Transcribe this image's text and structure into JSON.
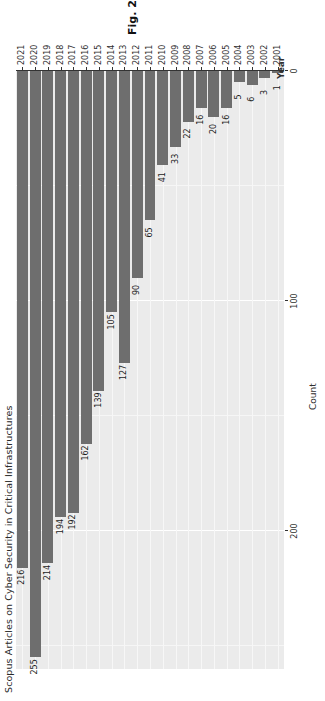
{
  "figure": {
    "caption_label": "Fig. 2",
    "caption_text": "Research trends 2001–21."
  },
  "chart_data": {
    "type": "bar",
    "orientation": "vertical",
    "title": "Scopus Articles on Cyber Security in Critical Infrastructures",
    "xlabel": "Year",
    "ylabel": "Count",
    "ylim": [
      0,
      260
    ],
    "yticks": [
      0,
      100,
      200
    ],
    "ytick_labels": [
      "0",
      "100",
      "200"
    ],
    "grid": true,
    "legend": "none",
    "bar_color": "#6e6e6e",
    "panel_color": "#ebebeb",
    "gridline_color": "#ffffff",
    "categories": [
      "2001",
      "2002",
      "2003",
      "2004",
      "2005",
      "2006",
      "2007",
      "2008",
      "2009",
      "2010",
      "2011",
      "2012",
      "2013",
      "2014",
      "2015",
      "2016",
      "2017",
      "2018",
      "2019",
      "2020",
      "2021"
    ],
    "values": [
      1,
      3,
      6,
      5,
      16,
      20,
      16,
      22,
      33,
      41,
      65,
      90,
      127,
      105,
      139,
      162,
      192,
      194,
      214,
      255,
      216
    ],
    "data_labels": [
      "1",
      "3",
      "6",
      "5",
      "16",
      "20",
      "16",
      "22",
      "33",
      "41",
      "65",
      "90",
      "127",
      "105",
      "139",
      "162",
      "192",
      "194",
      "214",
      "255",
      "216"
    ]
  }
}
